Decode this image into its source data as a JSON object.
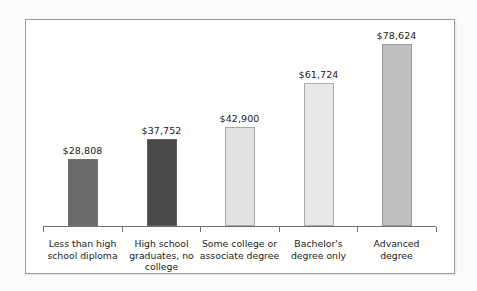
{
  "chart_data": {
    "type": "bar",
    "title": "",
    "subtitle": "",
    "xlabel": "",
    "ylabel": "",
    "grid": false,
    "legend": "none",
    "axis_visible": {
      "x": true,
      "y": false
    },
    "ylim": [
      0,
      78624
    ],
    "categories": [
      "Less than high\nschool diploma",
      "High school\ngraduates, no\ncollege",
      "Some college or\nassociate degree",
      "Bachelor's\ndegree only",
      "Advanced\ndegree"
    ],
    "values": [
      28808,
      37752,
      42900,
      61724,
      78624
    ],
    "value_labels": [
      "$28,808",
      "$37,752",
      "$42,900",
      "$61,724",
      "$78,624"
    ],
    "bar_colors": [
      "#6b6b6b",
      "#4a4a4a",
      "#e2e2e2",
      "#e8e8e8",
      "#c0c0c0"
    ]
  },
  "frame": {
    "border_color": "#9a9a9a",
    "background": "#ffffff"
  },
  "page": {
    "background": "#fbfbfb"
  },
  "axis": {
    "color": "#6f6f6f"
  }
}
